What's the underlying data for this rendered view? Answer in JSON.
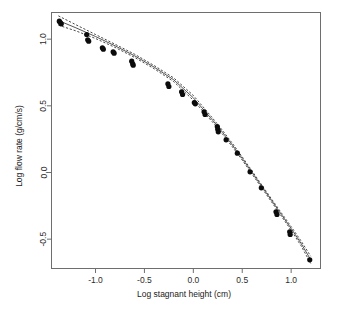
{
  "chart_data": {
    "type": "scatter",
    "title": "",
    "subtitle": "",
    "xlabel": "Log stagnant height (cm)",
    "ylabel": "Log flow rate (g/cm/s)",
    "xlim": [
      -1.45,
      1.3
    ],
    "ylim": [
      -0.72,
      1.2
    ],
    "xticks": [
      -1.0,
      -0.5,
      0.0,
      0.5,
      1.0
    ],
    "xtick_labels": [
      "-1.0",
      "-0.5",
      "0.0",
      "0.5",
      "1.0"
    ],
    "yticks": [
      1.0,
      0.5,
      0.0,
      -0.5
    ],
    "ytick_labels": [
      "1.0",
      "0.5",
      "0.0",
      "-0.5"
    ],
    "grid": false,
    "legend": null,
    "frame": true,
    "points": [
      {
        "x": -1.37,
        "y": 1.135
      },
      {
        "x": -1.36,
        "y": 1.125
      },
      {
        "x": -1.35,
        "y": 1.115
      },
      {
        "x": -1.09,
        "y": 1.035
      },
      {
        "x": -1.08,
        "y": 0.995
      },
      {
        "x": -1.07,
        "y": 0.985
      },
      {
        "x": -0.93,
        "y": 0.935
      },
      {
        "x": -0.92,
        "y": 0.925
      },
      {
        "x": -0.82,
        "y": 0.905
      },
      {
        "x": -0.81,
        "y": 0.895
      },
      {
        "x": -0.63,
        "y": 0.835
      },
      {
        "x": -0.62,
        "y": 0.815
      },
      {
        "x": -0.615,
        "y": 0.805
      },
      {
        "x": -0.26,
        "y": 0.665
      },
      {
        "x": -0.25,
        "y": 0.645
      },
      {
        "x": -0.12,
        "y": 0.605
      },
      {
        "x": -0.11,
        "y": 0.585
      },
      {
        "x": 0.01,
        "y": 0.525
      },
      {
        "x": 0.02,
        "y": 0.515
      },
      {
        "x": 0.11,
        "y": 0.455
      },
      {
        "x": 0.12,
        "y": 0.435
      },
      {
        "x": 0.245,
        "y": 0.345
      },
      {
        "x": 0.25,
        "y": 0.325
      },
      {
        "x": 0.255,
        "y": 0.305
      },
      {
        "x": 0.335,
        "y": 0.245
      },
      {
        "x": 0.45,
        "y": 0.145
      },
      {
        "x": 0.58,
        "y": 0.005
      },
      {
        "x": 0.695,
        "y": -0.115
      },
      {
        "x": 0.845,
        "y": -0.295
      },
      {
        "x": 0.855,
        "y": -0.315
      },
      {
        "x": 0.985,
        "y": -0.445
      },
      {
        "x": 0.99,
        "y": -0.465
      },
      {
        "x": 1.19,
        "y": -0.655
      }
    ],
    "fit_line": {
      "name": "fitted-curve",
      "style": "solid",
      "x": [
        -1.38,
        -1.2,
        -1.0,
        -0.8,
        -0.6,
        -0.4,
        -0.2,
        0.0,
        0.1,
        0.2,
        0.3,
        0.4,
        0.5,
        0.6,
        0.7,
        0.8,
        0.9,
        1.0,
        1.1,
        1.2
      ],
      "y": [
        1.14,
        1.085,
        1.02,
        0.95,
        0.875,
        0.79,
        0.695,
        0.56,
        0.475,
        0.39,
        0.3,
        0.205,
        0.105,
        0.0,
        -0.105,
        -0.21,
        -0.315,
        -0.42,
        -0.53,
        -0.655
      ]
    },
    "confidence_bands": [
      {
        "name": "upper-confidence-band",
        "style": "dashed",
        "x": [
          -1.38,
          -1.2,
          -1.0,
          -0.8,
          -0.6,
          -0.4,
          -0.2,
          0.0,
          0.1,
          0.2,
          0.3,
          0.4,
          0.5,
          0.6,
          0.7,
          0.8,
          0.9,
          1.0,
          1.1,
          1.2
        ],
        "y": [
          1.175,
          1.108,
          1.035,
          0.962,
          0.887,
          0.802,
          0.709,
          0.578,
          0.492,
          0.405,
          0.314,
          0.218,
          0.117,
          0.012,
          -0.094,
          -0.199,
          -0.303,
          -0.406,
          -0.512,
          -0.628
        ]
      },
      {
        "name": "lower-confidence-band",
        "style": "dashed",
        "x": [
          -1.38,
          -1.2,
          -1.0,
          -0.8,
          -0.6,
          -0.4,
          -0.2,
          0.0,
          0.1,
          0.2,
          0.3,
          0.4,
          0.5,
          0.6,
          0.7,
          0.8,
          0.9,
          1.0,
          1.1,
          1.2
        ],
        "y": [
          1.105,
          1.062,
          1.005,
          0.938,
          0.863,
          0.778,
          0.681,
          0.542,
          0.458,
          0.375,
          0.286,
          0.192,
          0.093,
          -0.012,
          -0.116,
          -0.221,
          -0.327,
          -0.434,
          -0.548,
          -0.682
        ]
      }
    ]
  }
}
